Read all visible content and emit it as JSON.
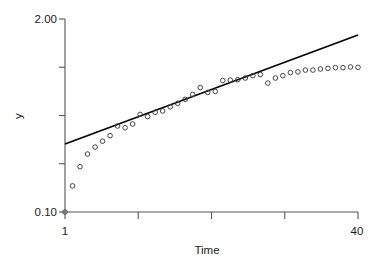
{
  "chart_data": {
    "type": "scatter",
    "title": "",
    "xlabel": "Time",
    "ylabel": "y",
    "yscale": "log",
    "xlim": [
      1,
      40
    ],
    "ylim": [
      0.1,
      2.0
    ],
    "grid": false,
    "legend": null,
    "x_tick_labels": [
      "1",
      "",
      "",
      "",
      "40"
    ],
    "x_tick_values": [
      1,
      10.75,
      20.5,
      30.25,
      40
    ],
    "y_tick_labels": [
      "2.00",
      "",
      "",
      "",
      "0.10"
    ],
    "y_tick_values": [
      2.0,
      1.2,
      0.66,
      0.37,
      0.1
    ],
    "series": [
      {
        "name": "observations",
        "marker": "open-circle",
        "x": [
          1,
          2,
          3,
          4,
          5,
          6,
          7,
          8,
          9,
          10,
          11,
          12,
          13,
          14,
          15,
          16,
          17,
          18,
          19,
          20,
          21,
          22,
          23,
          24,
          25,
          26,
          27,
          28,
          29,
          30,
          31,
          32,
          33,
          34,
          35,
          36,
          37,
          38,
          39,
          40
        ],
        "y": [
          0.1,
          0.15,
          0.202,
          0.246,
          0.274,
          0.3,
          0.327,
          0.38,
          0.37,
          0.392,
          0.455,
          0.44,
          0.47,
          0.48,
          0.512,
          0.54,
          0.575,
          0.62,
          0.69,
          0.64,
          0.65,
          0.77,
          0.775,
          0.78,
          0.8,
          0.83,
          0.845,
          0.74,
          0.8,
          0.83,
          0.87,
          0.88,
          0.905,
          0.905,
          0.92,
          0.93,
          0.94,
          0.94,
          0.95,
          0.945
        ]
      },
      {
        "name": "fitted-line",
        "type": "line",
        "x": [
          1,
          40
        ],
        "y": [
          0.287,
          1.56
        ]
      }
    ]
  },
  "axes": {
    "y_axis_label": "y",
    "x_axis_label": "Time",
    "y_top_label": "2.00",
    "y_bottom_label": "0.10",
    "x_left_label": "1",
    "x_right_label": "40"
  },
  "colors": {
    "axis": "#555555",
    "marker_stroke": "#444444",
    "line": "#000000",
    "background": "#ffffff",
    "text": "#1a1a1a"
  }
}
